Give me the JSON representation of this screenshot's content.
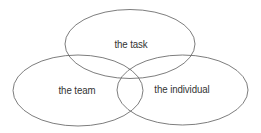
{
  "diagram": {
    "type": "venn",
    "stroke_color": "#6e6e6e",
    "text_color": "#333333",
    "sets": [
      {
        "id": "task",
        "label": "the task",
        "cx": 130,
        "cy": 44,
        "rx": 65,
        "ry": 34.5,
        "label_x": 131,
        "label_y": 44
      },
      {
        "id": "team",
        "label": "the team",
        "cx": 78,
        "cy": 90.5,
        "rx": 65,
        "ry": 35.5,
        "label_x": 77,
        "label_y": 90
      },
      {
        "id": "individual",
        "label": "the individual",
        "cx": 182.5,
        "cy": 90,
        "rx": 65.5,
        "ry": 35,
        "label_x": 182,
        "label_y": 89
      }
    ]
  }
}
